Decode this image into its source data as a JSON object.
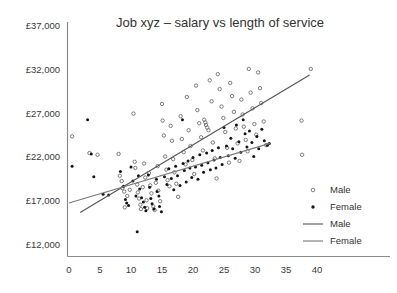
{
  "chart_data": {
    "type": "scatter",
    "title": "Job xyz – salary vs length of service",
    "xlabel": "",
    "ylabel": "",
    "xlim": [
      -1.5,
      41
    ],
    "ylim": [
      11200,
      37600
    ],
    "grid": false,
    "legend_position": "right",
    "xticks": [
      0,
      5,
      10,
      15,
      20,
      25,
      30,
      35,
      40
    ],
    "xtick_labels": [
      "0",
      "5",
      "10",
      "15",
      "20",
      "25",
      "30",
      "35",
      "40"
    ],
    "yticks": [
      12000,
      17000,
      22000,
      27000,
      32000,
      37000
    ],
    "ytick_labels": [
      "£12,000",
      "£17,000",
      "£22,000",
      "£27,000",
      "£32,000",
      "£37,000"
    ],
    "legend": [
      {
        "label": "Male",
        "kind": "marker",
        "marker": "open-circle",
        "color": "#707070"
      },
      {
        "label": "Female",
        "kind": "marker",
        "marker": "filled-circle",
        "color": "#1a1a1a"
      },
      {
        "label": "Male",
        "kind": "line",
        "color": "#555555"
      },
      {
        "label": "Female",
        "kind": "line",
        "color": "#777777"
      }
    ],
    "series": [
      {
        "name": "Male",
        "marker": "open-circle",
        "color": "#6e6e6e",
        "points": [
          [
            0.5,
            24400
          ],
          [
            3.3,
            22500
          ],
          [
            4.6,
            22300
          ],
          [
            8.0,
            22400
          ],
          [
            8.2,
            19900
          ],
          [
            8.5,
            19300
          ],
          [
            8.6,
            18500
          ],
          [
            8.9,
            18100
          ],
          [
            9.0,
            16300
          ],
          [
            9.4,
            17600
          ],
          [
            9.8,
            18300
          ],
          [
            10.4,
            27000
          ],
          [
            10.6,
            21500
          ],
          [
            10.7,
            20800
          ],
          [
            11.0,
            18900
          ],
          [
            11.1,
            18000
          ],
          [
            11.3,
            17300
          ],
          [
            11.5,
            16600
          ],
          [
            11.6,
            16100
          ],
          [
            11.9,
            18600
          ],
          [
            12.1,
            21300
          ],
          [
            12.3,
            19700
          ],
          [
            12.5,
            17100
          ],
          [
            12.6,
            16200
          ],
          [
            12.9,
            20200
          ],
          [
            13.1,
            18800
          ],
          [
            13.3,
            17900
          ],
          [
            13.6,
            16400
          ],
          [
            13.8,
            16000
          ],
          [
            14.0,
            19100
          ],
          [
            14.3,
            21000
          ],
          [
            14.4,
            18200
          ],
          [
            14.7,
            17000
          ],
          [
            15.0,
            28100
          ],
          [
            15.1,
            26200
          ],
          [
            15.3,
            24500
          ],
          [
            15.5,
            22100
          ],
          [
            15.7,
            20600
          ],
          [
            15.9,
            19400
          ],
          [
            16.2,
            18700
          ],
          [
            16.4,
            25600
          ],
          [
            16.6,
            23900
          ],
          [
            16.8,
            21800
          ],
          [
            17.0,
            20300
          ],
          [
            17.3,
            19000
          ],
          [
            17.6,
            17500
          ],
          [
            18.0,
            26700
          ],
          [
            18.2,
            24100
          ],
          [
            18.5,
            22600
          ],
          [
            18.8,
            21200
          ],
          [
            19.0,
            28900
          ],
          [
            19.3,
            25100
          ],
          [
            19.6,
            23300
          ],
          [
            19.9,
            21700
          ],
          [
            20.2,
            20100
          ],
          [
            20.5,
            30200
          ],
          [
            20.7,
            27400
          ],
          [
            21.0,
            25900
          ],
          [
            21.3,
            24300
          ],
          [
            21.6,
            22800
          ],
          [
            21.8,
            26300
          ],
          [
            22.0,
            26000
          ],
          [
            22.1,
            25700
          ],
          [
            22.3,
            25400
          ],
          [
            22.5,
            25100
          ],
          [
            22.7,
            30800
          ],
          [
            23.0,
            28400
          ],
          [
            23.2,
            23700
          ],
          [
            23.5,
            21900
          ],
          [
            23.8,
            19600
          ],
          [
            24.0,
            31500
          ],
          [
            24.3,
            29800
          ],
          [
            24.6,
            27800
          ],
          [
            24.9,
            26500
          ],
          [
            25.2,
            24900
          ],
          [
            25.5,
            23100
          ],
          [
            25.8,
            21400
          ],
          [
            26.0,
            30500
          ],
          [
            26.3,
            29000
          ],
          [
            26.6,
            27200
          ],
          [
            26.9,
            25300
          ],
          [
            27.2,
            23600
          ],
          [
            27.5,
            21600
          ],
          [
            27.8,
            28600
          ],
          [
            28.0,
            26900
          ],
          [
            28.2,
            25500
          ],
          [
            28.5,
            24000
          ],
          [
            28.8,
            22700
          ],
          [
            29.0,
            32100
          ],
          [
            29.3,
            29400
          ],
          [
            29.6,
            27600
          ],
          [
            29.9,
            25800
          ],
          [
            30.2,
            24600
          ],
          [
            30.5,
            31700
          ],
          [
            30.8,
            29900
          ],
          [
            31.0,
            28200
          ],
          [
            31.4,
            26100
          ],
          [
            31.8,
            23400
          ],
          [
            37.5,
            26200
          ],
          [
            37.6,
            22300
          ],
          [
            39.0,
            32100
          ]
        ]
      },
      {
        "name": "Female",
        "marker": "filled-circle",
        "color": "#151515",
        "points": [
          [
            0.5,
            21000
          ],
          [
            3.0,
            26300
          ],
          [
            3.6,
            22400
          ],
          [
            4.0,
            19800
          ],
          [
            5.5,
            17800
          ],
          [
            6.4,
            17700
          ],
          [
            8.3,
            20400
          ],
          [
            8.8,
            18700
          ],
          [
            9.1,
            17200
          ],
          [
            9.3,
            16800
          ],
          [
            9.6,
            16500
          ],
          [
            10.0,
            20900
          ],
          [
            10.3,
            19300
          ],
          [
            10.8,
            17600
          ],
          [
            11.0,
            13500
          ],
          [
            11.2,
            19900
          ],
          [
            11.4,
            18400
          ],
          [
            11.7,
            17400
          ],
          [
            12.0,
            16900
          ],
          [
            12.2,
            16300
          ],
          [
            12.4,
            15900
          ],
          [
            12.8,
            20000
          ],
          [
            13.0,
            18600
          ],
          [
            13.2,
            17300
          ],
          [
            13.4,
            16700
          ],
          [
            13.7,
            16100
          ],
          [
            14.1,
            19500
          ],
          [
            14.2,
            18100
          ],
          [
            14.5,
            17600
          ],
          [
            14.6,
            16400
          ],
          [
            14.9,
            15800
          ],
          [
            15.4,
            19800
          ],
          [
            15.8,
            18900
          ],
          [
            16.1,
            20700
          ],
          [
            16.5,
            19600
          ],
          [
            16.9,
            18300
          ],
          [
            17.2,
            21000
          ],
          [
            17.5,
            19900
          ],
          [
            17.9,
            18800
          ],
          [
            18.3,
            26300
          ],
          [
            18.4,
            21300
          ],
          [
            18.6,
            20500
          ],
          [
            18.9,
            19200
          ],
          [
            19.2,
            21600
          ],
          [
            19.5,
            20800
          ],
          [
            19.8,
            19700
          ],
          [
            20.0,
            22000
          ],
          [
            20.4,
            20900
          ],
          [
            20.8,
            19500
          ],
          [
            21.1,
            22300
          ],
          [
            21.4,
            21100
          ],
          [
            21.7,
            20300
          ],
          [
            22.2,
            22500
          ],
          [
            22.4,
            21400
          ],
          [
            22.8,
            20600
          ],
          [
            23.1,
            22800
          ],
          [
            23.4,
            21700
          ],
          [
            23.7,
            20800
          ],
          [
            24.1,
            23100
          ],
          [
            24.4,
            22000
          ],
          [
            24.7,
            21200
          ],
          [
            25.0,
            25400
          ],
          [
            25.4,
            23300
          ],
          [
            25.7,
            22200
          ],
          [
            26.1,
            24200
          ],
          [
            26.4,
            23000
          ],
          [
            26.8,
            21900
          ],
          [
            27.0,
            25700
          ],
          [
            27.4,
            23800
          ],
          [
            27.7,
            22600
          ],
          [
            28.1,
            26300
          ],
          [
            28.4,
            24700
          ],
          [
            28.7,
            23200
          ],
          [
            29.1,
            25000
          ],
          [
            29.5,
            23700
          ],
          [
            29.8,
            22100
          ],
          [
            30.3,
            24400
          ],
          [
            30.6,
            23000
          ],
          [
            31.1,
            25200
          ],
          [
            31.5,
            23900
          ],
          [
            32.0,
            23400
          ],
          [
            32.3,
            23600
          ]
        ]
      }
    ],
    "trendlines": [
      {
        "name": "Male",
        "color": "#555555",
        "x0": 1.8,
        "y0": 15700,
        "x1": 38.8,
        "y1": 31400
      },
      {
        "name": "Female",
        "color": "#7a7a7a",
        "x0": 0.0,
        "y0": 16800,
        "x1": 32.4,
        "y1": 23600
      }
    ]
  }
}
